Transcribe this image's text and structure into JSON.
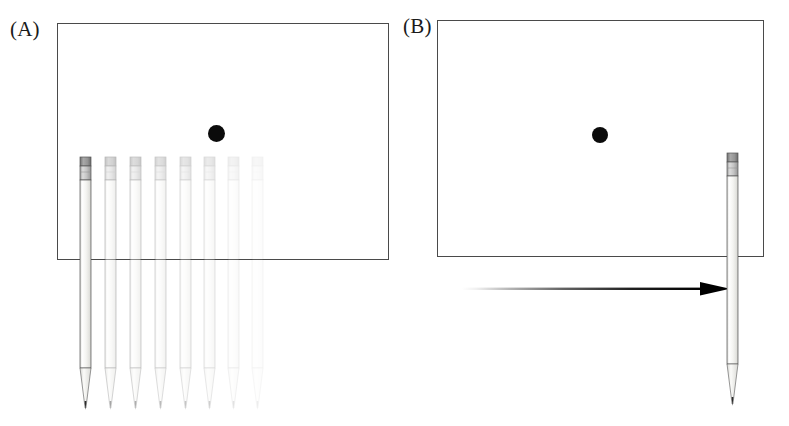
{
  "figure": {
    "background_color": "#ffffff",
    "width": 789,
    "height": 426,
    "caption_style": "two-panel scientific illustration"
  },
  "panels": [
    {
      "id": "A",
      "label": "(A)",
      "frame": {
        "x": 57,
        "y": 23,
        "width": 332,
        "height": 237,
        "stroke": "#4a4a4a"
      },
      "dot": {
        "label": "target dot",
        "x": 216,
        "y": 133,
        "diameter": 17,
        "color": "#0b0b0b"
      },
      "description": "multiple overlaid pencil positions fading to the right",
      "pencils": [
        {
          "x": 78,
          "opacity": 1.0
        },
        {
          "x": 103,
          "opacity": 0.42
        },
        {
          "x": 128,
          "opacity": 0.38
        },
        {
          "x": 153,
          "opacity": 0.32
        },
        {
          "x": 178,
          "opacity": 0.27
        },
        {
          "x": 202,
          "opacity": 0.22
        },
        {
          "x": 226,
          "opacity": 0.13
        },
        {
          "x": 250,
          "opacity": 0.08
        }
      ]
    },
    {
      "id": "B",
      "label": "(B)",
      "frame": {
        "x": 437,
        "y": 20,
        "width": 327,
        "height": 237,
        "stroke": "#4a4a4a"
      },
      "dot": {
        "label": "target dot",
        "x": 600,
        "y": 135,
        "diameter": 16,
        "color": "#0b0b0b"
      },
      "description": "single pencil at right edge with fading motion arrow pointing right",
      "pencils": [
        {
          "x": 725,
          "opacity": 1.0
        }
      ],
      "arrow": {
        "label": "motion arrow",
        "x_start": 462,
        "x_end": 732,
        "y": 289,
        "color": "#000000",
        "fade": "transparent at tail, solid at head",
        "direction": "right"
      }
    }
  ],
  "pencil_parts": {
    "eraser_label": "eraser",
    "ferrule_label": "metal ferrule",
    "body_label": "pencil barrel",
    "tip_label": "sharpened tip",
    "eraser_color": "#8c8c8c",
    "ferrule_color": "#bdbdbd",
    "body_color": "#f2f2f0",
    "outline_color": "#555555"
  }
}
